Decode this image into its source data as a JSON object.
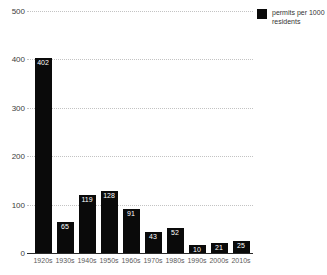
{
  "chart_data": {
    "type": "bar",
    "title": "",
    "xlabel": "",
    "ylabel": "",
    "categories": [
      "1920s",
      "1930s",
      "1940s",
      "1950s",
      "1960s",
      "1970s",
      "1980s",
      "1990s",
      "2000s",
      "2010s"
    ],
    "values": [
      402,
      65,
      119,
      128,
      91,
      43,
      52,
      10,
      21,
      25
    ],
    "series_name": "permits per 1000 residents",
    "ylim": [
      0,
      500
    ],
    "yticks": [
      0,
      100,
      200,
      300,
      400,
      500
    ],
    "grid": "horizontal dotted",
    "legend_position": "top-right",
    "bar_color": "#0a0a0a",
    "value_label_color": "#ffffff",
    "grid_color": "#c3c3c3",
    "axis_label_color": "#3c3c3c"
  },
  "legend": {
    "line1": "permits per 1000",
    "line2": "residents",
    "swatch_color": "#0a0a0a"
  }
}
